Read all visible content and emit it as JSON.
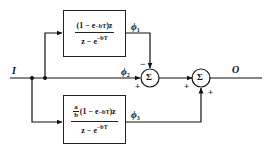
{
  "diagram": {
    "type": "block-diagram",
    "input_label": "I",
    "output_label": "O",
    "blocks": [
      {
        "id": "upper",
        "numerator": "(1 − e",
        "numerator_exp": "−bT",
        "numerator_tail": ")z",
        "denominator": "z − e",
        "denominator_exp": "−bT",
        "output_signal": "ϕ",
        "output_signal_sub": "1"
      },
      {
        "id": "lower",
        "coef_num": "a",
        "coef_den": "b",
        "numerator": "(1 − e",
        "numerator_exp": "−bT",
        "numerator_tail": ")z",
        "denominator": "z − e",
        "denominator_exp": "−bT",
        "output_signal": "ϕ",
        "output_signal_sub": "3"
      }
    ],
    "direct_path": {
      "signal": "ϕ",
      "signal_sub": "2"
    },
    "summing_junctions": [
      {
        "symbol": "Σ",
        "inputs": [
          {
            "from": "ϕ1",
            "sign": "−"
          },
          {
            "from": "ϕ2",
            "sign": "+"
          }
        ]
      },
      {
        "symbol": "Σ",
        "inputs": [
          {
            "from": "Σ1",
            "sign": "+"
          },
          {
            "from": "ϕ3",
            "sign": "+"
          }
        ]
      }
    ]
  }
}
